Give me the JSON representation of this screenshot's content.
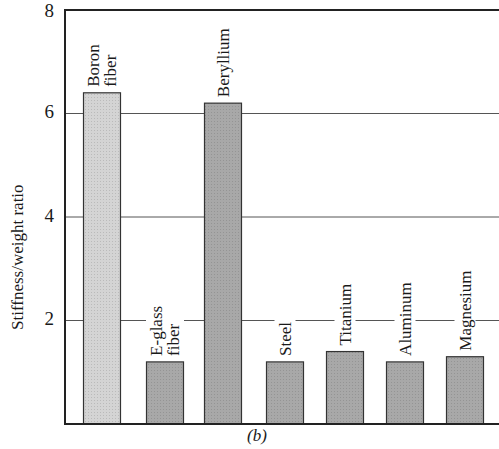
{
  "chart_data": {
    "type": "bar",
    "title": "",
    "caption": "(b)",
    "xlabel": "",
    "ylabel": "Stiffness/weight ratio",
    "ylim": [
      0,
      8
    ],
    "yticks": [
      2,
      4,
      6,
      8
    ],
    "grid": true,
    "legend": null,
    "categories": [
      "Boron fiber",
      "E-glass fiber",
      "Beryllium",
      "Steel",
      "Titanium",
      "Aluminum",
      "Magnesium"
    ],
    "category_lines": [
      [
        "Boron",
        "fiber"
      ],
      [
        "E-glass",
        "fiber"
      ],
      [
        "Beryllium"
      ],
      [
        "Steel"
      ],
      [
        "Titanium"
      ],
      [
        "Aluminum"
      ],
      [
        "Magnesium"
      ]
    ],
    "values": [
      6.4,
      1.2,
      6.2,
      1.2,
      1.4,
      1.2,
      1.3
    ],
    "bar_colors": [
      "#d4d4d4",
      "#a8a8a8",
      "#a8a8a8",
      "#a8a8a8",
      "#a8a8a8",
      "#a8a8a8",
      "#a8a8a8"
    ]
  },
  "labels": {
    "ylabel": "Stiffness/weight ratio",
    "caption": "(b)",
    "tick_2": "2",
    "tick_4": "4",
    "tick_6": "6",
    "tick_8": "8"
  }
}
